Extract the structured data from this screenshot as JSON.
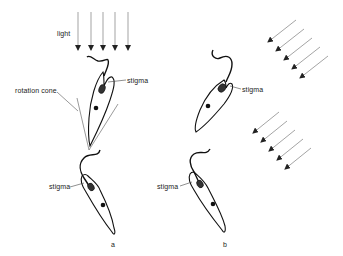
{
  "figure": {
    "labels": {
      "light": "light",
      "rotation_cone": "rotation  cone",
      "stigma_a_top": "stigma",
      "stigma_a_bottom": "stigma",
      "stigma_b_top": "stigma",
      "stigma_b_bottom": "stigma",
      "panel_a": "a",
      "panel_b": "b"
    },
    "light_arrows": {
      "vertical_count": 5,
      "diagonal_upper_count": 5,
      "diagonal_lower_count": 5,
      "color": "#555555"
    },
    "colors": {
      "outline": "#111111",
      "leader": "#444444",
      "background": "#ffffff"
    }
  }
}
